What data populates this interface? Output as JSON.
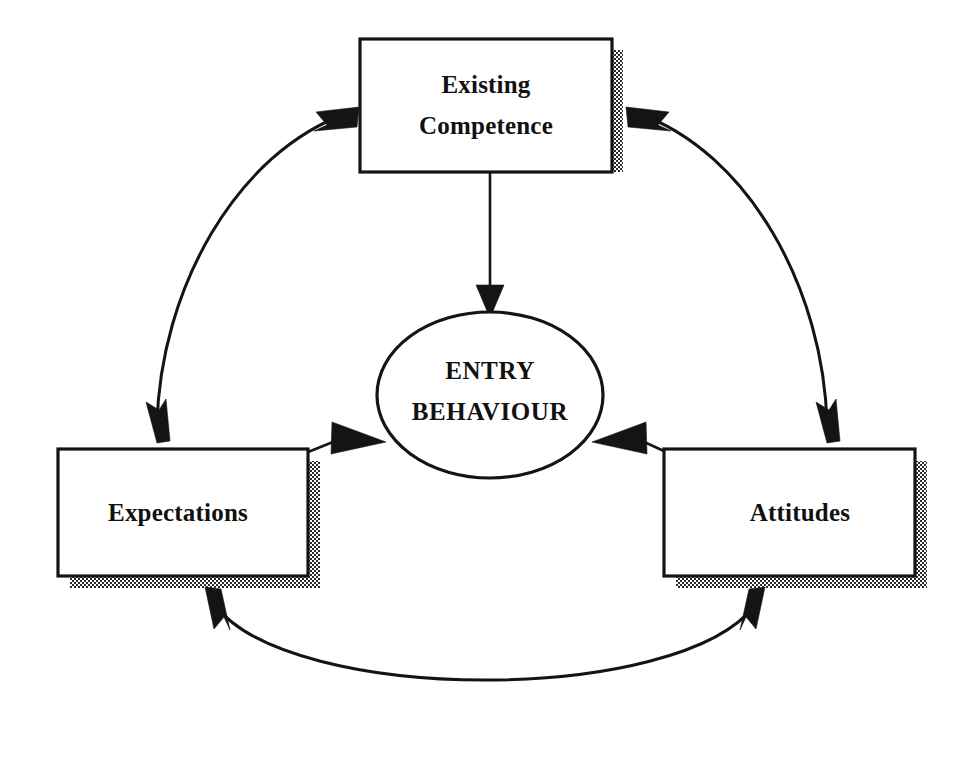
{
  "diagram": {
    "type": "cycle-diagram",
    "background_color": "#ffffff",
    "stroke_color": "#141414",
    "shadow_style": "checkered-halftone",
    "nodes": [
      {
        "id": "existing-competence",
        "shape": "rectangle",
        "label_line1": "Existing",
        "label_line2": "Competence",
        "x": 360,
        "y": 39,
        "width": 252,
        "height": 133
      },
      {
        "id": "entry-behaviour",
        "shape": "ellipse",
        "label_line1": "ENTRY",
        "label_line2": "BEHAVIOUR",
        "cx": 490,
        "cy": 395,
        "rx": 113,
        "ry": 83
      },
      {
        "id": "expectations",
        "shape": "rectangle",
        "label_line1": "Expectations",
        "label_line2": "",
        "x": 58,
        "y": 449,
        "width": 250,
        "height": 127
      },
      {
        "id": "attitudes",
        "shape": "rectangle",
        "label_line1": "Attitudes",
        "label_line2": "",
        "x": 664,
        "y": 449,
        "width": 251,
        "height": 127
      }
    ],
    "edges": [
      {
        "id": "competence-to-entry",
        "from": "existing-competence",
        "to": "entry-behaviour",
        "style": "straight",
        "arrows": "single",
        "direction": "down"
      },
      {
        "id": "competence-expectations",
        "from": "existing-competence",
        "to": "expectations",
        "style": "curved",
        "arrows": "double"
      },
      {
        "id": "competence-attitudes",
        "from": "existing-competence",
        "to": "attitudes",
        "style": "curved",
        "arrows": "double"
      },
      {
        "id": "expectations-attitudes",
        "from": "expectations",
        "to": "attitudes",
        "style": "curved",
        "arrows": "double"
      },
      {
        "id": "expectations-to-entry",
        "from": "expectations",
        "to": "entry-behaviour",
        "style": "straight",
        "arrows": "single",
        "direction": "right"
      },
      {
        "id": "attitudes-to-entry",
        "from": "attitudes",
        "to": "entry-behaviour",
        "style": "straight",
        "arrows": "single",
        "direction": "left"
      }
    ]
  }
}
